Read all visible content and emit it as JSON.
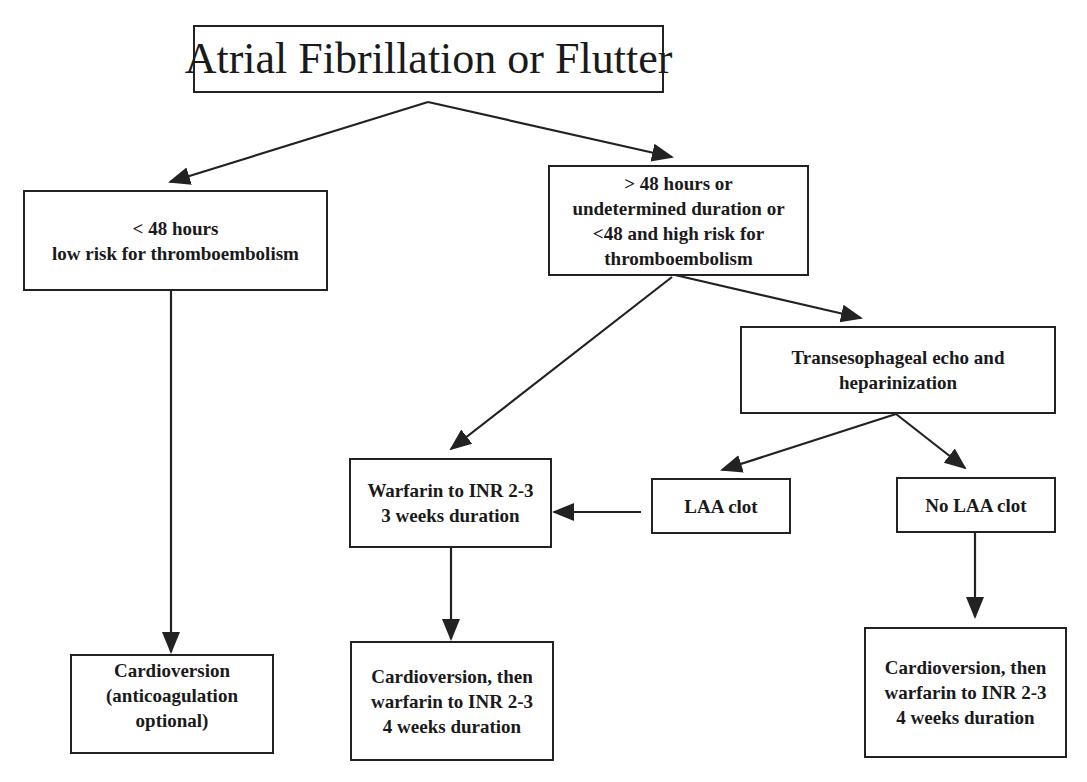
{
  "diagram": {
    "type": "flowchart",
    "nodes": {
      "root": {
        "lines": [
          "Atrial Fibrillation or Flutter"
        ]
      },
      "lt48": {
        "lines": [
          "< 48 hours",
          "low risk for thromboembolism"
        ]
      },
      "gt48": {
        "lines": [
          "> 48 hours or",
          "undetermined duration or",
          "<48 and high risk for",
          "thromboembolism"
        ]
      },
      "tee": {
        "lines": [
          "Transesophageal echo and",
          "heparinization"
        ]
      },
      "warfarin": {
        "lines": [
          "Warfarin to INR 2-3",
          "3 weeks duration"
        ]
      },
      "laa_clot": {
        "lines": [
          "LAA clot"
        ]
      },
      "no_laa_clot": {
        "lines": [
          "No LAA clot"
        ]
      },
      "cv_optional": {
        "lines": [
          "Cardioversion",
          "(anticoagulation",
          "optional)"
        ]
      },
      "cv_warfarin_mid": {
        "lines": [
          "Cardioversion, then",
          "warfarin to INR 2-3",
          "4 weeks duration"
        ]
      },
      "cv_warfarin_right": {
        "lines": [
          "Cardioversion, then",
          "warfarin to INR 2-3",
          "4 weeks duration"
        ]
      }
    },
    "edges": [
      {
        "from": "root",
        "to": "lt48"
      },
      {
        "from": "root",
        "to": "gt48"
      },
      {
        "from": "lt48",
        "to": "cv_optional"
      },
      {
        "from": "gt48",
        "to": "warfarin"
      },
      {
        "from": "gt48",
        "to": "tee"
      },
      {
        "from": "tee",
        "to": "laa_clot"
      },
      {
        "from": "tee",
        "to": "no_laa_clot"
      },
      {
        "from": "laa_clot",
        "to": "warfarin"
      },
      {
        "from": "warfarin",
        "to": "cv_warfarin_mid"
      },
      {
        "from": "no_laa_clot",
        "to": "cv_warfarin_right"
      }
    ],
    "colors": {
      "line": "#222222",
      "background": "#ffffff",
      "text": "#1a1a1a"
    }
  }
}
